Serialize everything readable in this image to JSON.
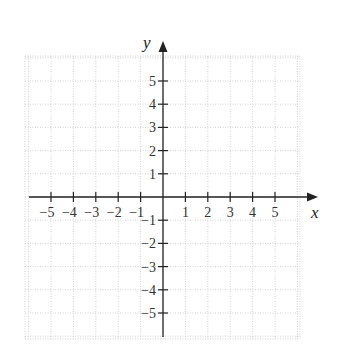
{
  "chart_data": {
    "type": "scatter",
    "title": "",
    "xlabel": "x",
    "ylabel": "y",
    "x_ticks": [
      -5,
      -4,
      -3,
      -2,
      -1,
      1,
      2,
      3,
      4,
      5
    ],
    "y_ticks": [
      5,
      4,
      3,
      2,
      1,
      -1,
      -2,
      -3,
      -4,
      -5
    ],
    "x_tick_labels": [
      "−5",
      "−4",
      "−3",
      "−2",
      "−1",
      "1",
      "2",
      "3",
      "4",
      "5"
    ],
    "y_tick_labels": [
      "5",
      "4",
      "3",
      "2",
      "1",
      "−1",
      "−2",
      "−3",
      "−4",
      "−5"
    ],
    "xlim": [
      -6,
      6
    ],
    "ylim": [
      -6,
      6
    ],
    "grid": true,
    "grid_style": "dotted",
    "series": [],
    "colors": {
      "axis": "#222222",
      "grid": "#c8c8c8",
      "text": "#333333"
    }
  },
  "axes": {
    "x_label": "x",
    "y_label": "y"
  }
}
